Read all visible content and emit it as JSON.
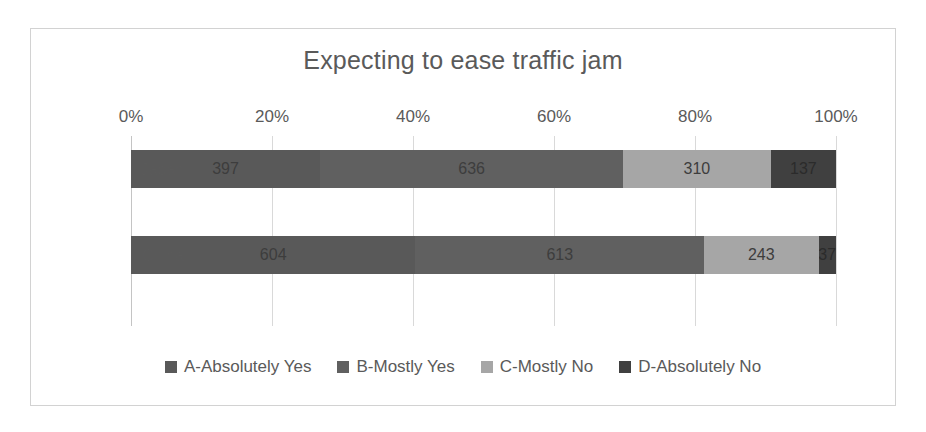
{
  "chart_data": {
    "type": "bar",
    "orientation": "horizontal",
    "stacked": true,
    "normalized": true,
    "title": "Expecting to ease traffic jam",
    "xlabel": "",
    "ylabel": "",
    "xlim": [
      0,
      100
    ],
    "grid": true,
    "legend_position": "bottom",
    "categories": [
      "Japan",
      "China"
    ],
    "tick_labels": [
      "0%",
      "20%",
      "40%",
      "60%",
      "80%",
      "100%"
    ],
    "tick_values": [
      0,
      20,
      40,
      60,
      80,
      100
    ],
    "series": [
      {
        "name": "A-Absolutely Yes",
        "color": "#595959",
        "values": [
          397,
          604
        ]
      },
      {
        "name": "B-Mostly Yes",
        "color": "#606060",
        "values": [
          636,
          613
        ]
      },
      {
        "name": "C-Mostly No",
        "color": "#a6a6a6",
        "values": [
          310,
          243
        ]
      },
      {
        "name": "D-Absolutely No",
        "color": "#404040",
        "values": [
          137,
          37
        ]
      }
    ],
    "totals": [
      1480,
      1497
    ]
  },
  "legend": {
    "items": [
      {
        "label": "A-Absolutely Yes",
        "color": "#595959"
      },
      {
        "label": "B-Mostly Yes",
        "color": "#606060"
      },
      {
        "label": "C-Mostly No",
        "color": "#a6a6a6"
      },
      {
        "label": "D-Absolutely No",
        "color": "#404040"
      }
    ]
  },
  "colors": {
    "frame_border": "#d2d2d2",
    "gridline": "#d9d9d9",
    "text": "#5a5a5a",
    "background": "#ffffff"
  }
}
